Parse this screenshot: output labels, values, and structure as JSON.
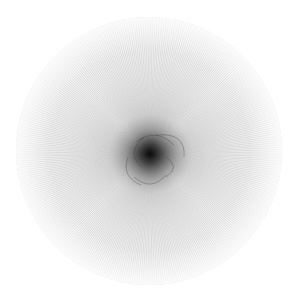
{
  "image": {
    "description": "Radial line moire pattern forming a grey disc with a dark swirl near the center",
    "colors": {
      "background": "#ffffff",
      "lines": "#8a8a8a",
      "center": "#1a1a1a"
    },
    "disc": {
      "cx": 149,
      "cy": 151,
      "r": 133
    },
    "ray_count": 360
  }
}
